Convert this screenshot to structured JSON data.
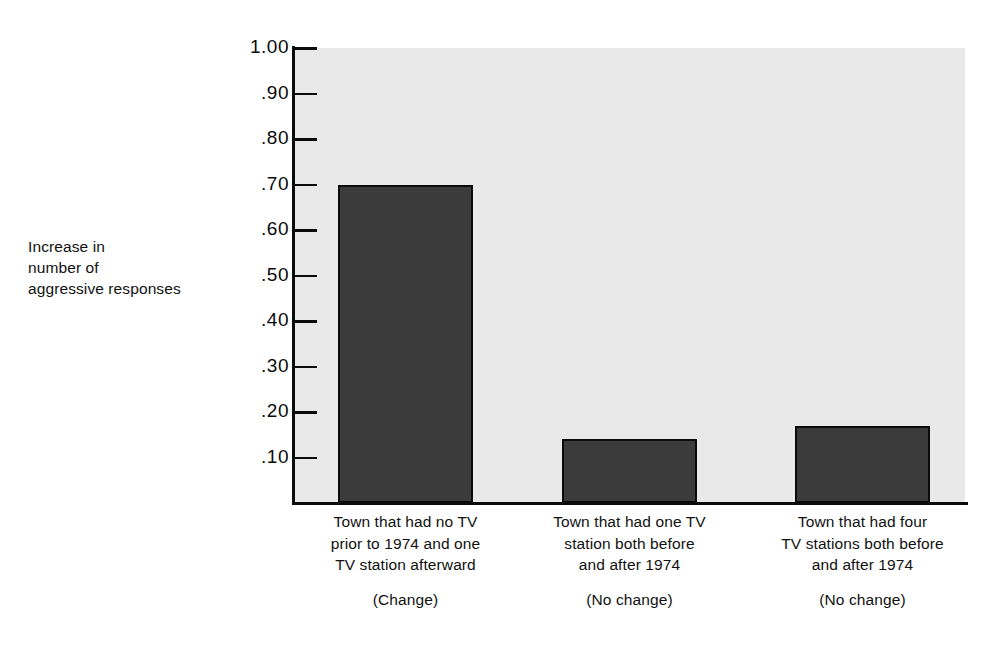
{
  "chart_data": {
    "type": "bar",
    "title": "",
    "xlabel": "",
    "ylabel": "Increase in number of aggressive responses",
    "ylim": [
      0,
      1.0
    ],
    "grid": false,
    "legend": "none",
    "categories": [
      "Town that had no TV prior to 1974 and one TV station afterward",
      "Town that had one TV station both before and after 1974",
      "Town that had four TV stations both before and after 1974"
    ],
    "category_notes": [
      "(Change)",
      "(No change)",
      "(No change)"
    ],
    "values": [
      0.7,
      0.14,
      0.17
    ],
    "ytick_labels": [
      "1.00",
      ".90",
      ".80",
      ".70",
      ".60",
      ".50",
      ".40",
      ".30",
      ".20",
      ".10"
    ],
    "ytick_values": [
      1.0,
      0.9,
      0.8,
      0.7,
      0.6,
      0.5,
      0.4,
      0.3,
      0.2,
      0.1
    ],
    "colors": {
      "bar_fill": "#3b3b3b",
      "bar_stroke": "#0b0b0b",
      "plot_background": "#e9e9e9",
      "page_background": "#ffffff",
      "text": "#111111"
    }
  },
  "axis": {
    "y_label_lines": [
      "Increase in",
      "number of",
      "aggressive responses"
    ]
  },
  "categories": [
    {
      "lines": [
        "Town that had no TV",
        "prior to 1974 and one",
        "TV station afterward"
      ],
      "note": "(Change)"
    },
    {
      "lines": [
        "Town that had one TV",
        "station both before",
        "and after 1974"
      ],
      "note": "(No change)"
    },
    {
      "lines": [
        "Town that had four",
        "TV stations both before",
        "and after 1974"
      ],
      "note": "(No change)"
    }
  ],
  "ticks": [
    {
      "label": "1.00"
    },
    {
      "label": ".90"
    },
    {
      "label": ".80"
    },
    {
      "label": ".70"
    },
    {
      "label": ".60"
    },
    {
      "label": ".50"
    },
    {
      "label": ".40"
    },
    {
      "label": ".30"
    },
    {
      "label": ".20"
    },
    {
      "label": ".10"
    }
  ]
}
